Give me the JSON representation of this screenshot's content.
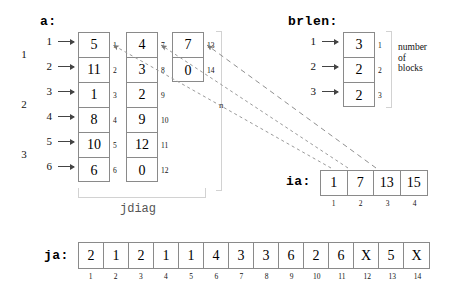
{
  "diagram": {
    "title_a": "a:",
    "title_brlen": "brlen:",
    "title_ia": "ia:",
    "title_ja": "ja:",
    "label_jdiag": "jdiag",
    "note_blocks": "number\nof\nblocks",
    "marker_n": "n"
  },
  "a_array": {
    "block_labels": [
      "1",
      "2",
      "3"
    ],
    "row_labels": [
      "1",
      "2",
      "3",
      "4",
      "5",
      "6"
    ],
    "columns": [
      {
        "values": [
          "5",
          "11",
          "1",
          "8",
          "10",
          "6"
        ],
        "indices": [
          "1",
          "2",
          "3",
          "4",
          "5",
          "6"
        ]
      },
      {
        "values": [
          "4",
          "3",
          "2",
          "9",
          "12",
          "0"
        ],
        "indices": [
          "7",
          "8",
          "9",
          "10",
          "11",
          "12"
        ]
      },
      {
        "values": [
          "7",
          "0"
        ],
        "indices": [
          "13",
          "14"
        ]
      }
    ]
  },
  "brlen_array": {
    "row_labels": [
      "1",
      "2",
      "3"
    ],
    "values": [
      "3",
      "2",
      "2"
    ],
    "indices": [
      "1",
      "2",
      "3"
    ]
  },
  "ia_array": {
    "values": [
      "1",
      "7",
      "13",
      "15"
    ],
    "indices": [
      "1",
      "2",
      "3",
      "4"
    ]
  },
  "ja_array": {
    "values": [
      "2",
      "1",
      "2",
      "1",
      "1",
      "4",
      "3",
      "3",
      "6",
      "2",
      "6",
      "X",
      "5",
      "X"
    ],
    "indices": [
      "1",
      "2",
      "3",
      "4",
      "5",
      "6",
      "7",
      "8",
      "9",
      "10",
      "11",
      "12",
      "13",
      "14"
    ]
  },
  "colors": {
    "cell_border": "#8a8a8a",
    "bracket": "#d2d2d2",
    "arrow_dashed": "#9a9a9a",
    "text": "#000000"
  }
}
